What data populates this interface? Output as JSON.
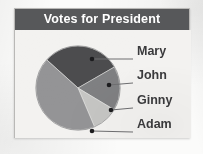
{
  "card": {
    "title": "Votes for President",
    "title_bar_color": "#57585a",
    "title_text_color": "#ffffff",
    "plot_background": "#f3f2f0",
    "border_color": "#b9b8b6"
  },
  "chart_data": {
    "type": "pie",
    "title": "Votes for President",
    "xlabel": "",
    "ylabel": "",
    "legend_position": "right-callouts",
    "grid": false,
    "categories": [
      "Mary",
      "John",
      "Ginny",
      "Adam"
    ],
    "values": [
      30,
      17,
      10,
      43
    ],
    "slices": [
      {
        "label": "Mary",
        "value": 30,
        "color": "#4c4c4e",
        "start_angle_deg": 312,
        "end_angle_deg": 60,
        "callout_dot": {
          "x": 77,
          "y": 50
        },
        "label_position": {
          "x": 136,
          "y": 50
        }
      },
      {
        "label": "John",
        "value": 17,
        "color": "#7f8082",
        "start_angle_deg": 60,
        "end_angle_deg": 121,
        "callout_dot": {
          "x": 94,
          "y": 76
        },
        "label_position": {
          "x": 136,
          "y": 74
        }
      },
      {
        "label": "Ginny",
        "value": 10,
        "color": "#c6c6c4",
        "start_angle_deg": 121,
        "end_angle_deg": 157,
        "callout_dot": {
          "x": 96,
          "y": 101
        },
        "label_position": {
          "x": 136,
          "y": 99
        }
      },
      {
        "label": "Adam",
        "value": 43,
        "color": "#949496",
        "start_angle_deg": 157,
        "end_angle_deg": 312,
        "callout_dot": {
          "x": 77,
          "y": 122
        },
        "label_position": {
          "x": 136,
          "y": 123
        }
      }
    ],
    "geometry": {
      "center_x": 76,
      "center_y": 87,
      "radius": 42
    }
  },
  "labels": {
    "mary": "Mary",
    "john": "John",
    "ginny": "Ginny",
    "adam": "Adam"
  },
  "colors": {
    "slice_mary": "#4c4c4e",
    "slice_john": "#7f8082",
    "slice_ginny": "#c6c6c4",
    "slice_adam": "#949496",
    "leader_line": "#6e6e70",
    "label_text": "#3a3a3c"
  }
}
